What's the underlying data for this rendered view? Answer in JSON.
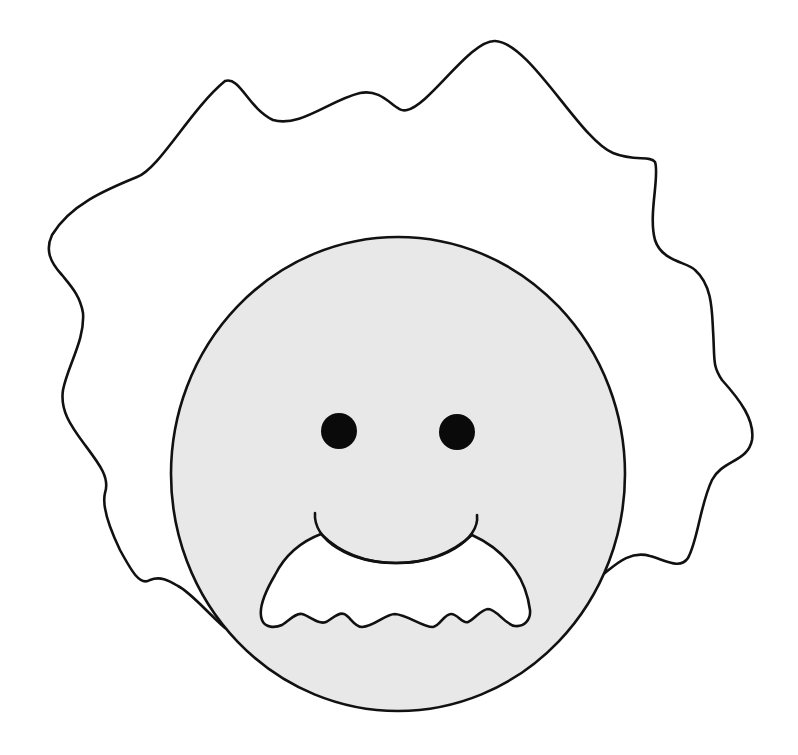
{
  "illustration": {
    "subject": "cartoon face with wild hair and mustache",
    "colors": {
      "background": "#ffffff",
      "outline": "#111111",
      "hair_fill": "#ffffff",
      "face_fill": "#e8e8e8",
      "eye_fill": "#0a0a0a",
      "mustache_fill": "#ffffff"
    },
    "face": {
      "cx": 398,
      "cy": 474,
      "rx": 227,
      "ry": 237
    },
    "eyes": [
      {
        "name": "left-eye",
        "cx": 339,
        "cy": 431,
        "r": 18
      },
      {
        "name": "right-eye",
        "cx": 457,
        "cy": 432,
        "r": 18
      }
    ],
    "stroke_width": 2.6
  }
}
